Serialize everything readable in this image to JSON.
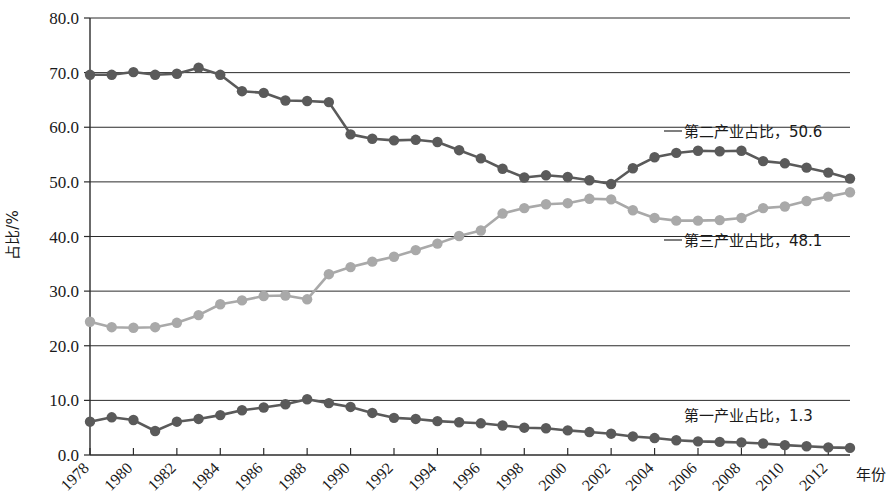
{
  "chart_data": {
    "type": "line",
    "title": "",
    "xlabel": "年份",
    "ylabel": "占比/%",
    "ylim": [
      0,
      80
    ],
    "xlim": [
      1978,
      2013
    ],
    "grid": true,
    "legend_position": "inline-right-annotations",
    "ytick_labels": [
      "0.0",
      "10.0",
      "20.0",
      "30.0",
      "40.0",
      "50.0",
      "60.0",
      "70.0",
      "80.0"
    ],
    "ytick_values": [
      0,
      10,
      20,
      30,
      40,
      50,
      60,
      70,
      80
    ],
    "xtick_labels": [
      "1978",
      "1980",
      "1982",
      "1984",
      "1986",
      "1988",
      "1990",
      "1992",
      "1994",
      "1996",
      "1998",
      "2000",
      "2002",
      "2004",
      "2006",
      "2008",
      "2010",
      "2012"
    ],
    "xtick_values": [
      1978,
      1980,
      1982,
      1984,
      1986,
      1988,
      1990,
      1992,
      1994,
      1996,
      1998,
      2000,
      2002,
      2004,
      2006,
      2008,
      2010,
      2012
    ],
    "x": [
      1978,
      1979,
      1980,
      1981,
      1982,
      1983,
      1984,
      1985,
      1986,
      1987,
      1988,
      1989,
      1990,
      1991,
      1992,
      1993,
      1994,
      1995,
      1996,
      1997,
      1998,
      1999,
      2000,
      2001,
      2002,
      2003,
      2004,
      2005,
      2006,
      2007,
      2008,
      2009,
      2010,
      2011,
      2012,
      2013
    ],
    "series": [
      {
        "name": "第二产业占比",
        "color": "#5a5a5a",
        "marker": "circle",
        "end_label": "第二产业占比，50.6",
        "end_value": 50.6,
        "values": [
          69.6,
          69.6,
          70.1,
          69.6,
          69.8,
          70.9,
          69.6,
          66.6,
          66.3,
          64.9,
          64.8,
          64.6,
          58.7,
          57.9,
          57.6,
          57.7,
          57.3,
          55.8,
          54.3,
          52.4,
          50.8,
          51.2,
          50.9,
          50.3,
          49.6,
          52.5,
          54.5,
          55.3,
          55.7,
          55.6,
          55.7,
          53.8,
          53.4,
          52.6,
          51.7,
          50.6
        ]
      },
      {
        "name": "第三产业占比",
        "color": "#a9a9a9",
        "marker": "circle",
        "end_label": "第三产业占比，48.1",
        "end_value": 48.1,
        "values": [
          24.4,
          23.4,
          23.3,
          23.4,
          24.2,
          25.6,
          27.6,
          28.3,
          29.1,
          29.2,
          28.5,
          33.1,
          34.4,
          35.4,
          36.3,
          37.5,
          38.7,
          40.1,
          41.1,
          44.2,
          45.2,
          45.9,
          46.1,
          46.9,
          46.8,
          44.8,
          43.4,
          42.9,
          42.9,
          43.0,
          43.4,
          45.2,
          45.5,
          46.5,
          47.3,
          48.1
        ]
      },
      {
        "name": "第一产业占比",
        "color": "#5a5a5a",
        "marker": "circle",
        "end_label": "第一产业占比，1.3",
        "end_value": 1.3,
        "values": [
          6.1,
          6.9,
          6.4,
          4.4,
          6.1,
          6.6,
          7.3,
          8.2,
          8.7,
          9.3,
          10.2,
          9.5,
          8.8,
          7.7,
          6.8,
          6.6,
          6.2,
          6.0,
          5.8,
          5.4,
          5.0,
          4.9,
          4.5,
          4.2,
          3.9,
          3.4,
          3.1,
          2.7,
          2.5,
          2.4,
          2.3,
          2.1,
          1.8,
          1.6,
          1.4,
          1.3
        ]
      }
    ],
    "annotations": [
      {
        "text": "第二产业占比，50.6",
        "value": 50.6
      },
      {
        "text": "第三产业占比，48.1",
        "value": 48.1
      },
      {
        "text": "第一产业占比，1.3",
        "value": 1.3
      }
    ]
  }
}
